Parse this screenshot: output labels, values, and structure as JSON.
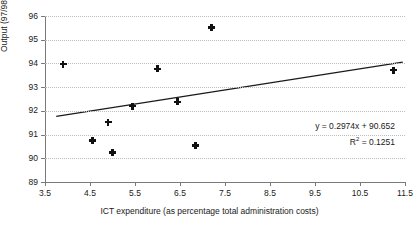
{
  "chart_data": {
    "type": "scatter",
    "title": "",
    "xlabel": "ICT expenditure (as percentage total administration costs)",
    "ylabel": "Output (97/98 = 100)",
    "xlim": [
      3.5,
      11.5
    ],
    "ylim": [
      89,
      96
    ],
    "xticks": [
      "3.5",
      "4.5",
      "5.5",
      "6.5",
      "7.5",
      "8.5",
      "9.5",
      "10.5",
      "11.5"
    ],
    "yticks": [
      "89",
      "90",
      "91",
      "92",
      "93",
      "94",
      "95",
      "96"
    ],
    "grid": "horizontal-dotted",
    "legend": "none",
    "x": [
      3.9,
      4.55,
      4.9,
      5.0,
      5.45,
      6.0,
      6.45,
      6.85,
      7.2,
      11.25
    ],
    "y": [
      93.97,
      90.75,
      91.53,
      90.25,
      92.2,
      93.77,
      92.38,
      90.55,
      95.52,
      93.72
    ],
    "points": [
      {
        "x": 3.9,
        "y": 93.97
      },
      {
        "x": 4.55,
        "y": 90.75
      },
      {
        "x": 4.9,
        "y": 91.53
      },
      {
        "x": 5.0,
        "y": 90.25
      },
      {
        "x": 5.45,
        "y": 92.2
      },
      {
        "x": 6.0,
        "y": 93.77
      },
      {
        "x": 6.45,
        "y": 92.38
      },
      {
        "x": 6.85,
        "y": 90.55
      },
      {
        "x": 7.2,
        "y": 95.52
      },
      {
        "x": 11.25,
        "y": 93.72
      }
    ],
    "trendline": {
      "type": "linear",
      "slope": 0.2974,
      "intercept": 90.652,
      "r_squared": 0.1251,
      "x_start": 3.75,
      "x_end": 11.45,
      "equation_text": "y = 0.2974x + 90.652",
      "r2_prefix": "R",
      "r2_exponent": "2",
      "r2_value": " = 0.1251"
    },
    "colors": {
      "marker": "#111111",
      "trendline": "#1a1a1a",
      "grid": "#bdbdbd",
      "axis": "#7a7a7a",
      "background": "#ffffff"
    }
  }
}
